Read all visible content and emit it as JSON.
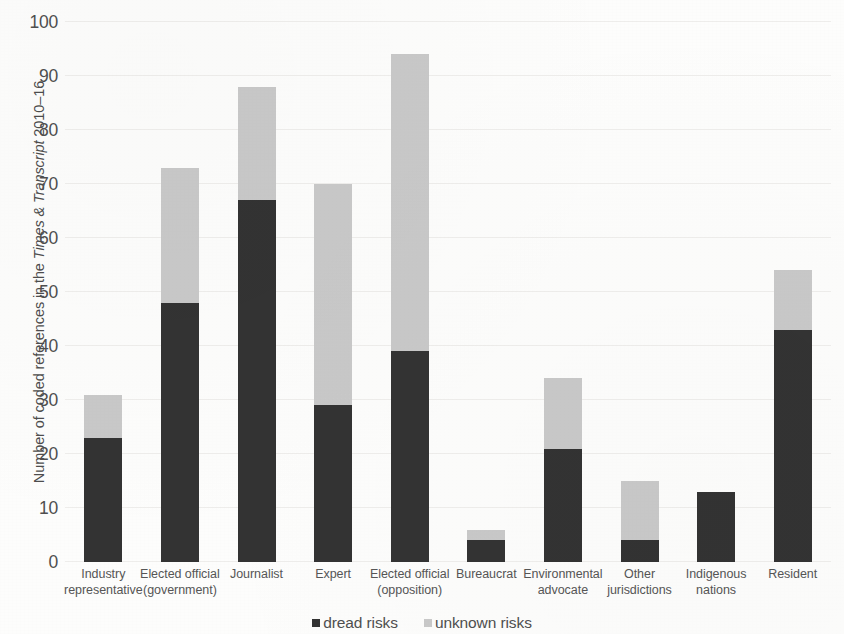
{
  "chart_data": {
    "type": "bar",
    "subtype": "stacked-bar",
    "title": "",
    "xlabel": "",
    "ylabel_parts": {
      "before": "Number of coded references in the ",
      "publication": "Times & Transcript",
      "after": " 2010–16"
    },
    "ylabel": "Number of coded references in the Times & Transcript 2010–16",
    "categories": [
      "Industry representative",
      "Elected official (government)",
      "Journalist",
      "Expert",
      "Elected official (opposition)",
      "Bureaucrat",
      "Environmental advocate",
      "Other jurisdictions",
      "Indigenous nations",
      "Resident"
    ],
    "category_lines": [
      [
        "Industry",
        "representative"
      ],
      [
        "Elected official",
        "(government)"
      ],
      [
        "Journalist",
        ""
      ],
      [
        "Expert",
        ""
      ],
      [
        "Elected official",
        "(opposition)"
      ],
      [
        "Bureaucrat",
        ""
      ],
      [
        "Environmental",
        "advocate"
      ],
      [
        "Other",
        "jurisdictions"
      ],
      [
        "Indigenous",
        "nations"
      ],
      [
        "Resident",
        ""
      ]
    ],
    "series": [
      {
        "name": "dread risks",
        "color": "#333333",
        "values": [
          23,
          48,
          67,
          29,
          39,
          4,
          21,
          4,
          13,
          43
        ]
      },
      {
        "name": "unknown risks",
        "color": "#c9c9c9",
        "values": [
          8,
          25,
          21,
          41,
          55,
          2,
          13,
          11,
          0,
          11
        ]
      }
    ],
    "totals": [
      31,
      73,
      88,
      70,
      94,
      6,
      34,
      15,
      13,
      54
    ],
    "ylim": [
      0,
      100
    ],
    "ytick_step": 10,
    "yticks": [
      0,
      10,
      20,
      30,
      40,
      50,
      60,
      70,
      80,
      90,
      100
    ],
    "ytick_labels": [
      "0",
      "10",
      "20",
      "30",
      "40",
      "50",
      "60",
      "70",
      "80",
      "90",
      "100"
    ],
    "grid": true,
    "grid_axis": "y",
    "legend_position": "bottom-center",
    "legend_entries": [
      {
        "label": "dread risks",
        "color": "#333333"
      },
      {
        "label": "unknown risks",
        "color": "#c9c9c9"
      }
    ]
  },
  "colors": {
    "dread": "#333333",
    "unknown": "#c9c9c9",
    "gridline": "#efeeec",
    "text": "#4f4f4f",
    "background": "#fdfdfc"
  }
}
